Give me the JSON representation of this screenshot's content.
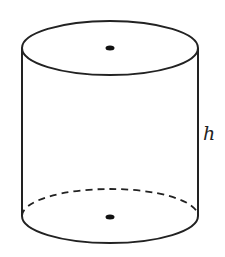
{
  "diagram": {
    "type": "cylinder",
    "labels": {
      "height": "h"
    },
    "colors": {
      "stroke": "#222222",
      "background": "#ffffff"
    },
    "geometry": {
      "cx": 110,
      "rx": 88,
      "ry": 27,
      "top_cy": 48,
      "bottom_cy": 216
    }
  }
}
